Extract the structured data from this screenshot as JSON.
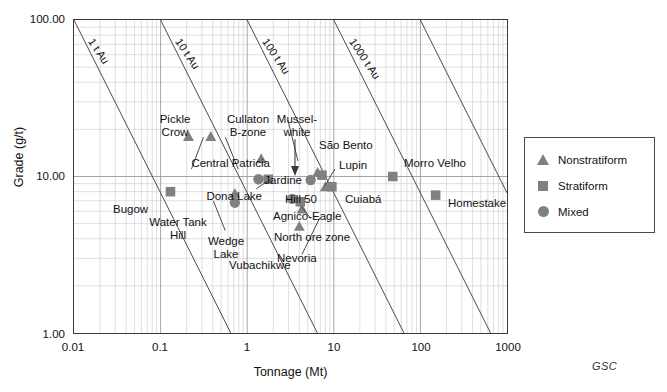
{
  "figure": {
    "credit": "GSC"
  },
  "axes": {
    "x_label": "Tonnage (Mt)",
    "y_label": "Grade (g/t)",
    "x_ticks": [
      "0.01",
      "0.1",
      "1",
      "10",
      "100",
      "1000"
    ],
    "y_ticks": [
      "1.00",
      "10.00",
      "100.00"
    ]
  },
  "contours": [
    {
      "label": "1 t Au"
    },
    {
      "label": "10 t Au"
    },
    {
      "label": "100 t Au"
    },
    {
      "label": "1000 t Au"
    }
  ],
  "legend": {
    "items": [
      {
        "label": "Nonstratiform",
        "symbol": "triangle"
      },
      {
        "label": "Stratiform",
        "symbol": "square"
      },
      {
        "label": "Mixed",
        "symbol": "circle"
      }
    ]
  },
  "labels": [
    {
      "id": "pickle-crow",
      "text": "Pickle\nCrow"
    },
    {
      "id": "cullaton-b-zone",
      "text": "Cullaton\nB-zone"
    },
    {
      "id": "musselwhite",
      "text": "Mussel-\nwhite"
    },
    {
      "id": "sao-bento",
      "text": "São Bento"
    },
    {
      "id": "lupin",
      "text": "Lupin"
    },
    {
      "id": "morro-velho",
      "text": "Morro Velho"
    },
    {
      "id": "central-patricia",
      "text": "Central Patricia"
    },
    {
      "id": "jardine",
      "text": "Jardine"
    },
    {
      "id": "dona-lake",
      "text": "Dona Lake"
    },
    {
      "id": "hill-50",
      "text": "Hill 50"
    },
    {
      "id": "cuiaba",
      "text": "Cuiabá"
    },
    {
      "id": "homestake",
      "text": "Homestake"
    },
    {
      "id": "bugow",
      "text": "Bugow"
    },
    {
      "id": "agnico-eagle",
      "text": "Agnico-Eagle"
    },
    {
      "id": "water-tank-hill",
      "text": "Water Tank\nHill"
    },
    {
      "id": "wedge-lake",
      "text": "Wedge\nLake"
    },
    {
      "id": "north-ore-zone",
      "text": "North ore zone"
    },
    {
      "id": "vubachikwe",
      "text": "Vubachikwe"
    },
    {
      "id": "nevoria",
      "text": "Nevoria"
    }
  ],
  "chart_data": {
    "type": "scatter",
    "title": "",
    "xlabel": "Tonnage (Mt)",
    "ylabel": "Grade (g/t)",
    "xscale": "log",
    "yscale": "log",
    "xlim": [
      0.01,
      1000
    ],
    "ylim": [
      1.0,
      100.0
    ],
    "grid": true,
    "legend_position": "right-outside",
    "marker_color": "#808080",
    "series": [
      {
        "name": "Nonstratiform",
        "marker": "triangle",
        "points": [
          {
            "label": "Pickle Crow",
            "x": 0.21,
            "y": 18.0
          },
          {
            "label": "Cullaton B-zone",
            "x": 0.38,
            "y": 18.0
          },
          {
            "label": "Central Patricia",
            "x": 1.45,
            "y": 13.0
          },
          {
            "label": "São Bento",
            "x": 6.5,
            "y": 10.6
          },
          {
            "label": "Hill 50",
            "x": 8.0,
            "y": 8.6
          },
          {
            "label": "Wedge Lake",
            "x": 0.72,
            "y": 7.8
          },
          {
            "label": "North ore zone",
            "x": 4.3,
            "y": 6.2
          },
          {
            "label": "Nevoria",
            "x": 4.0,
            "y": 4.8
          }
        ]
      },
      {
        "name": "Stratiform",
        "marker": "square",
        "points": [
          {
            "label": "Bugow",
            "x": 0.13,
            "y": 8.0
          },
          {
            "label": "Dona Lake",
            "x": 1.75,
            "y": 9.6
          },
          {
            "label": "Lupin",
            "x": 7.3,
            "y": 10.2
          },
          {
            "label": "Cuiabá",
            "x": 9.5,
            "y": 8.6
          },
          {
            "label": "Agnico-Eagle",
            "x": 4.1,
            "y": 6.9
          },
          {
            "label": "Morro Velho",
            "x": 48.0,
            "y": 10.0
          },
          {
            "label": "Homestake",
            "x": 150.0,
            "y": 7.6
          }
        ]
      },
      {
        "name": "Mixed",
        "marker": "circle",
        "points": [
          {
            "label": "Jardine",
            "x": 1.35,
            "y": 9.6
          },
          {
            "label": "Musselwhite",
            "x": 5.4,
            "y": 9.5
          },
          {
            "label": "Water Tank Hill",
            "x": 0.72,
            "y": 6.8
          },
          {
            "label": "Vubachikwe",
            "x": 3.3,
            "y": 7.2
          }
        ]
      }
    ],
    "contour_lines": [
      {
        "label": "1 t Au",
        "contained_gold_tonnes": 1
      },
      {
        "label": "10 t Au",
        "contained_gold_tonnes": 10
      },
      {
        "label": "100 t Au",
        "contained_gold_tonnes": 100
      },
      {
        "label": "1000 t Au",
        "contained_gold_tonnes": 1000
      }
    ]
  }
}
